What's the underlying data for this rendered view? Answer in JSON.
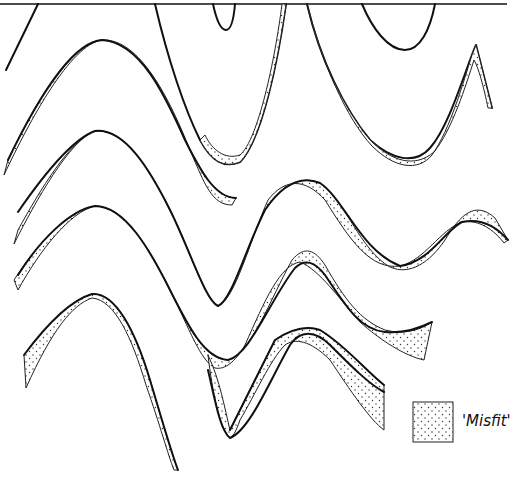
{
  "figure": {
    "type": "line-diagram",
    "colors": {
      "line": "#111111",
      "stipple": "#333333",
      "background": "#ffffff"
    }
  },
  "legend": {
    "swatch": "stippled-square",
    "label": "'Misfit'"
  }
}
